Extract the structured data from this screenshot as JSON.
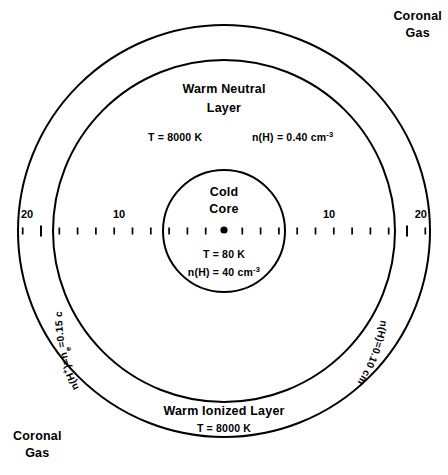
{
  "figure": {
    "title_alt": "Three-phase interstellar cloud model",
    "background_color": "#ffffff",
    "stroke_color": "#000000"
  },
  "labels": {
    "coronal_gas_top_right": "Coronal\nGas",
    "coronal_gas_bottom_left": "Coronal\nGas",
    "warm_neutral_layer": "Warm  Neutral\nLayer",
    "cold_core": "Cold\nCore",
    "warm_ionized_layer": "Warm Ionized Layer"
  },
  "values": {
    "warm_neutral_temperature": "T = 8000 K",
    "warm_neutral_density_prefix": "n(H) = 0.40 cm",
    "warm_neutral_density_exponent": "-3",
    "core_temperature": "T = 80 K",
    "core_density_prefix": "n(H) = 40 cm",
    "core_density_exponent": "-3",
    "warm_ionized_temperature": "T = 8000 K",
    "ionized_density_left": "n(H+)=ne=0.15 cm-3",
    "ionized_density_right": "n(H)=0.10 cm-3"
  },
  "arc_labels": {
    "left_parts": {
      "main": "n(H",
      "sup1": "+",
      "mid": ")=n",
      "sub1": "e",
      "tail": "=0.15 cm",
      "sup2": "-3"
    },
    "right_parts": {
      "main": "n(H)=0.10 cm",
      "sup": "-3"
    }
  },
  "scale": {
    "axis_y": 230,
    "center_x": 224,
    "center_dot_radius": 3.6,
    "tick_spacing_px": 18.3,
    "ticks_per_side": 11,
    "minor_tick_height": 7,
    "major_tick_height": 11,
    "major_tick_indices": [
      10,
      20
    ],
    "tick_labels": [
      {
        "text": "20",
        "x": 21,
        "y": 218,
        "anchor": "start"
      },
      {
        "text": "10",
        "x": 119,
        "y": 218,
        "anchor": "middle"
      },
      {
        "text": "10",
        "x": 329,
        "y": 218,
        "anchor": "middle"
      },
      {
        "text": "20",
        "x": 427,
        "y": 218,
        "anchor": "end"
      }
    ]
  },
  "circles": [
    {
      "name": "outer-coronal-boundary",
      "cx": 224,
      "cy": 231,
      "r": 206,
      "stroke_width": 2.0
    },
    {
      "name": "warm-ionized-boundary",
      "cx": 224,
      "cy": 231,
      "r": 171,
      "stroke_width": 2.0
    },
    {
      "name": "cold-core-boundary",
      "cx": 224,
      "cy": 231,
      "r": 61,
      "stroke_width": 2.0
    }
  ]
}
